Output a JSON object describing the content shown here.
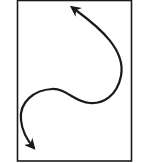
{
  "diagram": {
    "frame": {
      "x": 17.5,
      "y": 0.5,
      "width": 114,
      "height": 160.5,
      "stroke": "#1a1a1a",
      "stroke_width": 1.6,
      "fill": "#ffffff"
    },
    "curve": {
      "path": "M 77 11 C 100 28, 126 50, 121 76 C 117 96, 103 104, 90 103 C 74 102, 66 88, 52 89 C 34 90, 19 102, 21 120 C 22 132, 27 140, 34 148",
      "stroke": "#1a1a1a",
      "stroke_width": 2.2,
      "start_arrow": "arrowhead-up-left",
      "end_arrow": "arrowhead-down-right"
    },
    "colors": {
      "background": "#ffffff",
      "ink": "#1a1a1a"
    }
  }
}
